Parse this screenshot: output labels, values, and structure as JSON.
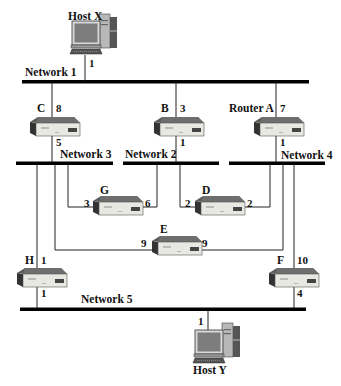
{
  "hosts": [
    {
      "id": "host-x",
      "label": "Host X",
      "port": "1"
    },
    {
      "id": "host-y",
      "label": "Host Y",
      "port": "1"
    }
  ],
  "networks": [
    {
      "id": "network-1",
      "label": "Network 1"
    },
    {
      "id": "network-2",
      "label": "Network 2"
    },
    {
      "id": "network-3",
      "label": "Network 3"
    },
    {
      "id": "network-4",
      "label": "Network 4"
    },
    {
      "id": "network-5",
      "label": "Network 5"
    }
  ],
  "routers": {
    "c": {
      "label": "C",
      "port_top": "8",
      "port_bottom": "5"
    },
    "b": {
      "label": "B",
      "port_top": "3",
      "port_bottom": "1"
    },
    "a": {
      "label": "Router A",
      "port_top": "7",
      "port_bottom": "1"
    },
    "g": {
      "label": "G",
      "port_left": "3",
      "port_right": "6"
    },
    "d": {
      "label": "D",
      "port_left": "2",
      "port_right": "2"
    },
    "e": {
      "label": "E",
      "port_left": "9",
      "port_right": "9"
    },
    "h": {
      "label": "H",
      "port_top": "1",
      "port_bottom": "1"
    },
    "f": {
      "label": "F",
      "port_top": "10",
      "port_bottom": "4"
    }
  },
  "colors": {
    "line": "#222222",
    "bus": "#000000",
    "router_front": "#e6e6e0",
    "router_top": "#6a6a6a",
    "router_side": "#3a3a3a",
    "screen": "#7a7a7a",
    "tower": "#9a9a9a"
  }
}
